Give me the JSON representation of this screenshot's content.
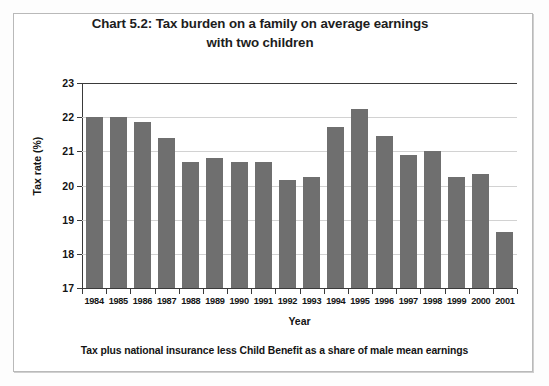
{
  "figure": {
    "title_line1": "Chart 5.2: Tax burden on a family on average earnings",
    "title_line2": "with two children",
    "footnote": "Tax plus national insurance less Child Benefit as a share of male mean earnings",
    "border_color": "#b9b9b9",
    "background_color": "#ffffff"
  },
  "chart_data": {
    "type": "bar",
    "title": "Chart 5.2: Tax burden on a family on average earnings with two children",
    "xlabel": "Year",
    "ylabel": "Tax rate (%)",
    "categories": [
      "1984",
      "1985",
      "1986",
      "1987",
      "1988",
      "1989",
      "1990",
      "1991",
      "1992",
      "1993",
      "1994",
      "1995",
      "1996",
      "1997",
      "1998",
      "1999",
      "2000",
      "2001"
    ],
    "values": [
      22.0,
      22.0,
      21.85,
      21.4,
      20.7,
      20.8,
      20.7,
      20.7,
      20.15,
      20.25,
      21.7,
      22.25,
      21.45,
      20.9,
      21.0,
      20.25,
      20.35,
      18.65
    ],
    "ylim": [
      17,
      23
    ],
    "yticks": [
      17,
      18,
      19,
      20,
      21,
      22,
      23
    ],
    "ytick_labels": [
      "17",
      "18",
      "19",
      "20",
      "21",
      "22",
      "23"
    ],
    "grid": true,
    "legend": false,
    "bar_color": "#6f6f6f",
    "grid_color": "#d2d2d2",
    "axis_color": "#3a3a3a"
  }
}
